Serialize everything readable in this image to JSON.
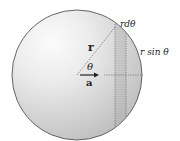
{
  "diagram": {
    "type": "sphere-surface-element",
    "sphere": {
      "center": [
        77,
        75
      ],
      "radius": 65,
      "fill_light": "#f4f4f4",
      "fill_dark": "#bdbdbd",
      "stroke": "#555555"
    },
    "strip": {
      "x_left": 115,
      "x_right": 126,
      "fill": "#c8c8c8"
    },
    "horizontal_dotted_y": 75,
    "labels": {
      "r_vector": "r",
      "theta": "θ",
      "a_vector": "a",
      "rdtheta": "rdθ",
      "rsintheta": "r sin θ"
    }
  }
}
